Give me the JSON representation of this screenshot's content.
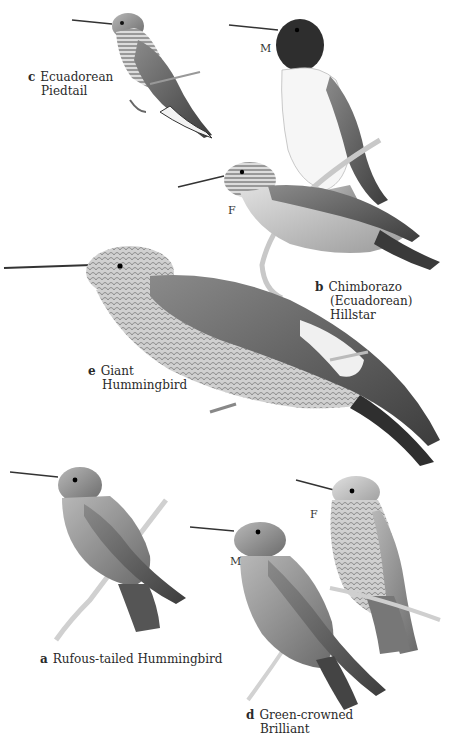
{
  "plate": {
    "description": "Field guide illustration plate of hummingbirds (grayscale)",
    "background": "#ffffff",
    "ink_color": "#2a2a2a"
  },
  "species": [
    {
      "id": "c",
      "letter": "c",
      "name_lines": [
        "Ecuadorean",
        "Piedtail"
      ],
      "sexes": []
    },
    {
      "id": "b",
      "letter": "b",
      "name_lines": [
        "Chimborazo",
        "(Ecuadorean)",
        "Hillstar"
      ],
      "sexes": [
        {
          "key": "male",
          "label": "M"
        },
        {
          "key": "female",
          "label": "F"
        }
      ]
    },
    {
      "id": "e",
      "letter": "e",
      "name_lines": [
        "Giant",
        "Hummingbird"
      ],
      "sexes": []
    },
    {
      "id": "a",
      "letter": "a",
      "name_lines": [
        "Rufous-tailed Hummingbird"
      ],
      "sexes": []
    },
    {
      "id": "d",
      "letter": "d",
      "name_lines": [
        "Green-crowned",
        "Brilliant"
      ],
      "sexes": [
        {
          "key": "male",
          "label": "M"
        },
        {
          "key": "female",
          "label": "F"
        }
      ]
    }
  ]
}
